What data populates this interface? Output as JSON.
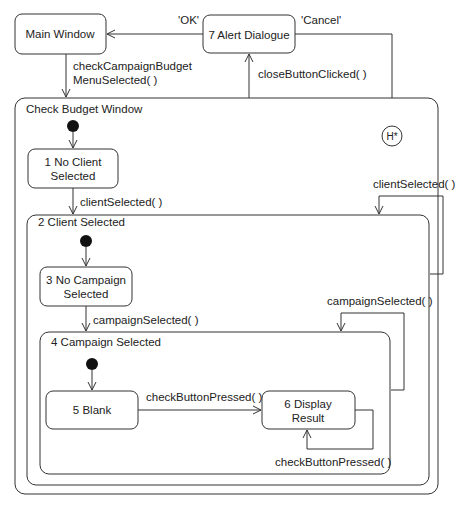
{
  "diagram": {
    "type": "UML state machine",
    "states": {
      "main_window": "Main Window",
      "alert_dialogue": "7 Alert Dialogue",
      "check_budget_window": "Check Budget Window",
      "no_client_selected": [
        "1 No Client",
        "Selected"
      ],
      "client_selected": "2 Client Selected",
      "no_campaign_selected": [
        "3 No Campaign",
        "Selected"
      ],
      "campaign_selected": "4 Campaign Selected",
      "blank": "5 Blank",
      "display_result": [
        "6 Display",
        "Result"
      ],
      "history": "H*"
    },
    "transitions": {
      "ok": "'OK'",
      "cancel": "'Cancel'",
      "check_campaign_budget": [
        "checkCampaignBudget",
        "MenuSelected( )"
      ],
      "close_button_clicked": "closeButtonClicked( )",
      "client_selected_1": "clientSelected( )",
      "client_selected_2": "clientSelected( )",
      "campaign_selected_1": "campaignSelected( )",
      "campaign_selected_2": "campaignSelected( )",
      "check_button_pressed_1": "checkButtonPressed( )",
      "check_button_pressed_2": "checkButtonPressed( )"
    }
  }
}
